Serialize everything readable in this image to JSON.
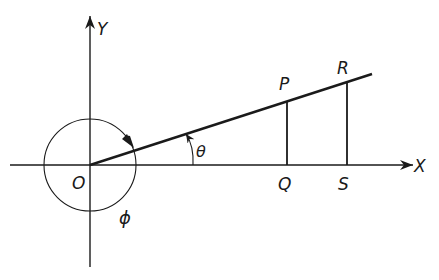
{
  "diagram": {
    "colors": {
      "stroke": "#1a1a1a",
      "background": "#ffffff"
    },
    "axes": {
      "x_label": "X",
      "y_label": "Y",
      "origin_label": "O"
    },
    "points": {
      "P": "P",
      "Q": "Q",
      "R": "R",
      "S": "S"
    },
    "angles": {
      "theta": "θ",
      "phi": "ϕ"
    }
  }
}
